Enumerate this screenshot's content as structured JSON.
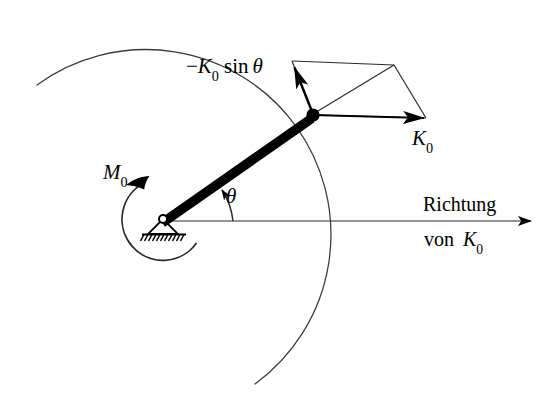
{
  "figure": {
    "background_color": "#ffffff",
    "ink_color": "#000000",
    "thin_line_color": "#2b2b2b",
    "width": 556,
    "height": 393
  },
  "labels": {
    "force_component": {
      "full_text": "−K₀ sin θ",
      "minus": "−",
      "symbol": "K",
      "subscript": "0",
      "function": "sin",
      "angle": "θ"
    },
    "force_resultant": {
      "full_text": "K₀",
      "symbol": "K",
      "subscript": "0"
    },
    "moment": {
      "full_text": "M₀",
      "symbol": "M",
      "subscript": "0"
    },
    "angle": {
      "full_text": "θ",
      "symbol": "θ"
    },
    "direction_line1": "Richtung",
    "direction_line2_prefix": "von",
    "direction_line2_symbol": "K",
    "direction_line2_subscript": "0"
  },
  "geometry": {
    "pivot": {
      "x": 163,
      "y": 219
    },
    "node": {
      "x": 313,
      "y": 114
    },
    "rod_angle_degrees": 35,
    "rod_length": 183,
    "big_arc_radius": 172,
    "moment_arc_radius": 41,
    "parallelogram": {
      "node": {
        "x": 313,
        "y": 114
      },
      "upper_left": {
        "x": 292,
        "y": 61
      },
      "upper_right": {
        "x": 394,
        "y": 65
      },
      "right": {
        "x": 426,
        "y": 118
      }
    },
    "horizontal_axis": {
      "x1": 163,
      "y1": 221,
      "x2": 538,
      "y2": 221
    },
    "k0_arrow": {
      "from_x": 313,
      "from_y": 115,
      "to_x": 426,
      "to_y": 118
    },
    "sin_component_arrow": {
      "from_x": 313,
      "from_y": 114,
      "to_x": 292,
      "to_y": 61
    }
  },
  "elements": {
    "pivot_support_name": "hinged-pin-support",
    "node_name": "rod-tip-node",
    "hatch_count": 11
  }
}
